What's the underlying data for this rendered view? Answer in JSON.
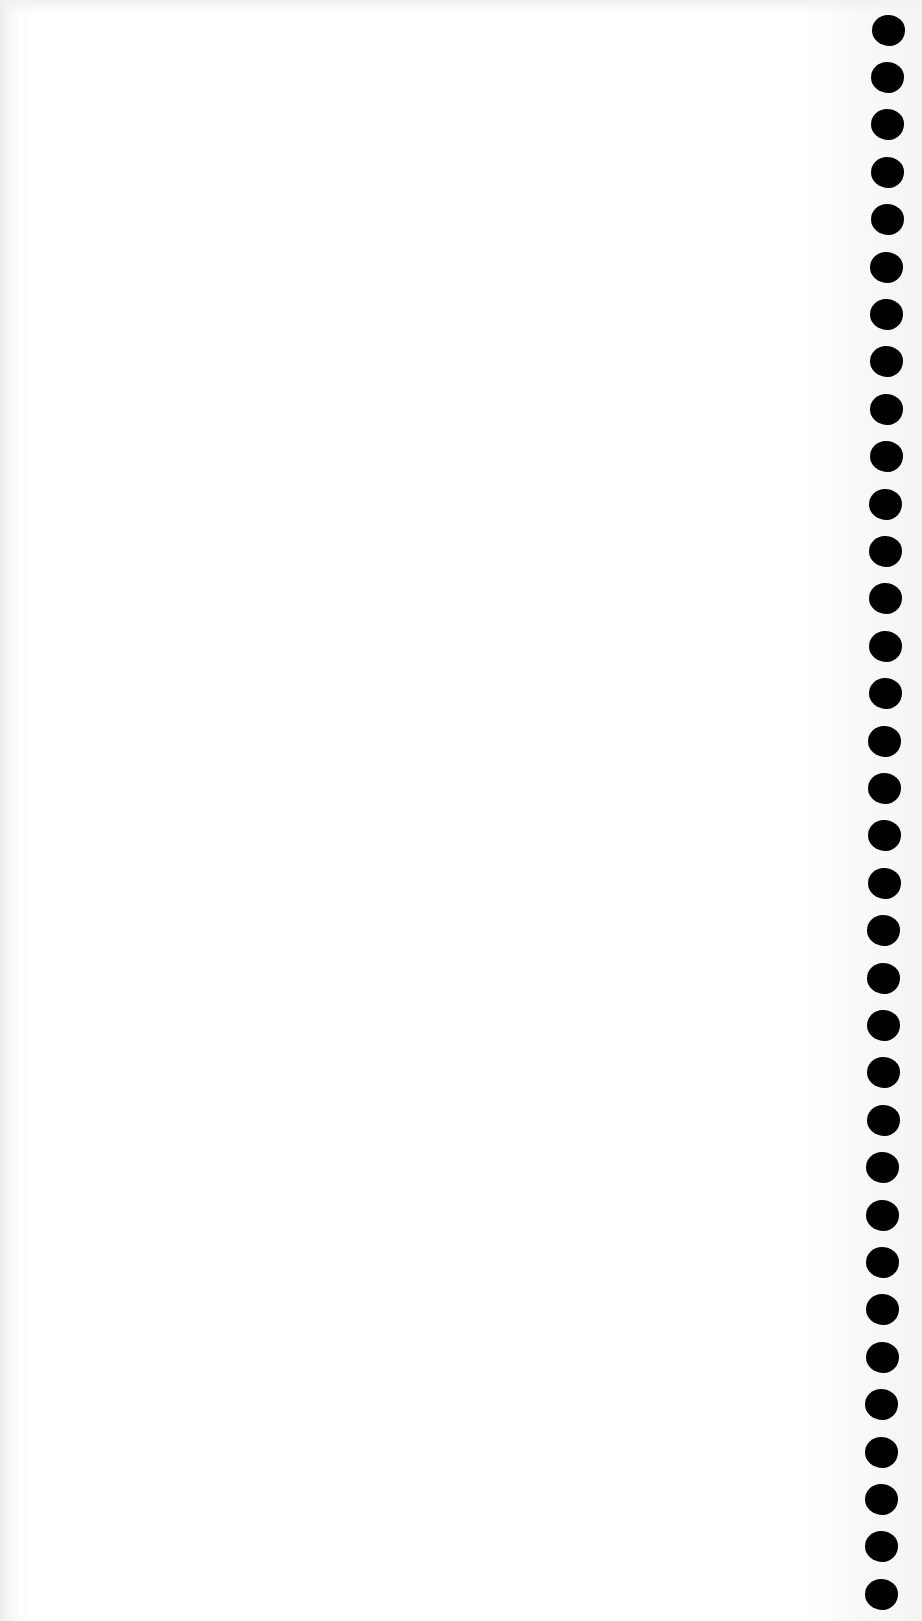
{
  "page": {
    "type": "blank scanned notebook page",
    "background_color": "#ffffff",
    "body_text": ""
  },
  "binding": {
    "side": "right",
    "hole_color": "#000000",
    "hole_count": 34,
    "hole_width": 33,
    "hole_height": 31,
    "first_hole_center_y": 30,
    "hole_spacing": 47.4,
    "center_x_top": 888,
    "center_x_bottom": 881
  }
}
